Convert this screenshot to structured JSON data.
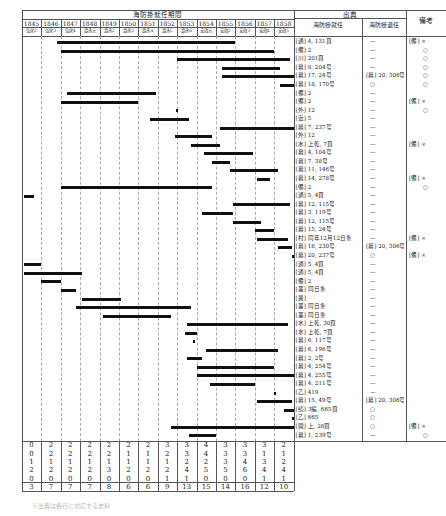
{
  "title": "海防掛就任期間",
  "source_header": "出典",
  "source_sub": [
    "海防掛就任",
    "海防掛退任"
  ],
  "remarks_header": "備考",
  "years": [
    "1845",
    "1846",
    "1847",
    "1848",
    "1849",
    "1850",
    "1851",
    "1852",
    "1853",
    "1854",
    "1855",
    "1856",
    "1857",
    "1858"
  ],
  "eras": [
    "弘化2",
    "弘化3",
    "弘化4",
    "嘉永元",
    "嘉永2",
    "嘉永3",
    "嘉永4",
    "嘉永5",
    "嘉永6",
    "安政元",
    "安政2",
    "安政3",
    "安政4",
    "安政5"
  ],
  "rows": [
    {
      "start": 1.8,
      "end": 11.0,
      "src_in": "[通] 4, 131頁",
      "src_out": "—",
      "note": "[備] ×"
    },
    {
      "start": 2.0,
      "end": 13.0,
      "src_in": "[備] 2",
      "src_out": "—",
      "note": "○"
    },
    {
      "start": 8.0,
      "end": 13.8,
      "src_in": "[川] 201頁",
      "src_out": "—",
      "note": "○"
    },
    {
      "start": 10.3,
      "end": 13.3,
      "src_in": "[幕] 8, 204号",
      "src_out": "—",
      "note": "○"
    },
    {
      "start": 10.3,
      "end": 14.0,
      "src_in": "[幕] 17, 24号",
      "src_out": "[幕] 20, 306号",
      "note": "○"
    },
    {
      "start": 13.3,
      "end": 14.0,
      "src_in": "[幕] 18, 170号",
      "src_out": "○",
      "note": "○"
    },
    {
      "start": 2.3,
      "end": 6.9,
      "src_in": "[備] 2",
      "src_out": "—",
      "note": ""
    },
    {
      "start": 2.0,
      "end": 6.0,
      "src_in": "[備] 2",
      "src_out": "—",
      "note": "[備] ×"
    },
    {
      "start": 7.95,
      "end": 8.05,
      "src_in": "[外] 12",
      "src_out": "—",
      "note": "○"
    },
    {
      "start": 6.6,
      "end": 8.6,
      "src_in": "[近] 5",
      "src_out": "—",
      "note": ""
    },
    {
      "start": 10.2,
      "end": 14.0,
      "src_in": "[幕] 7, 237号",
      "src_out": "—",
      "note": ""
    },
    {
      "start": 7.9,
      "end": 9.8,
      "src_in": "[外] 12",
      "src_out": "—",
      "note": ""
    },
    {
      "start": 8.7,
      "end": 10.2,
      "src_in": "[水] 上乾, 7頁",
      "src_out": "—",
      "note": "[備] ×"
    },
    {
      "start": 9.4,
      "end": 11.9,
      "src_in": "[幕] 4, 104号",
      "src_out": "—",
      "note": ""
    },
    {
      "start": 9.8,
      "end": 10.7,
      "src_in": "[幕] 7, 38号",
      "src_out": "—",
      "note": ""
    },
    {
      "start": 10.7,
      "end": 13.2,
      "src_in": "[幕] 11, 146号",
      "src_out": "—",
      "note": ""
    },
    {
      "start": 12.1,
      "end": 12.8,
      "src_in": "[幕] 14, 278号",
      "src_out": "—",
      "note": "[備] ×"
    },
    {
      "start": 2.0,
      "end": 9.8,
      "src_in": "[備] 2",
      "src_out": "—",
      "note": "○"
    },
    {
      "start": 0.1,
      "end": 0.6,
      "src_in": "[通] 5, 4頁",
      "src_out": "—",
      "note": ""
    },
    {
      "start": 10.9,
      "end": 13.8,
      "src_in": "[幕] 12, 115号",
      "src_out": "—",
      "note": ""
    },
    {
      "start": 9.3,
      "end": 10.9,
      "src_in": "[幕] 3, 119号",
      "src_out": "—",
      "note": ""
    },
    {
      "start": 10.9,
      "end": 12.3,
      "src_in": "[幕] 12, 115号",
      "src_out": "—",
      "note": ""
    },
    {
      "start": 12.0,
      "end": 13.0,
      "src_in": "[幕] 15, 24号",
      "src_out": "—",
      "note": ""
    },
    {
      "start": 12.1,
      "end": 13.7,
      "src_in": "[村] 同年12月12日条",
      "src_out": "—",
      "note": "[備] ×"
    },
    {
      "start": 13.2,
      "end": 13.9,
      "src_in": "[幕] 18, 230号",
      "src_out": "[幕] 20, 306号",
      "note": ""
    },
    {
      "start": 13.9,
      "end": 14.0,
      "src_in": "[幕] 20, 237号",
      "src_out": "○",
      "note": "[備] ×"
    },
    {
      "start": 0.1,
      "end": 1.0,
      "src_in": "[通] 5, 4頁",
      "src_out": "—",
      "note": ""
    },
    {
      "start": 0.1,
      "end": 3.1,
      "src_in": "[通] 5, 4頁",
      "src_out": "—",
      "note": ""
    },
    {
      "start": 1.0,
      "end": 2.0,
      "src_in": "[備] 2",
      "src_out": "—",
      "note": ""
    },
    {
      "start": 2.0,
      "end": 2.8,
      "src_in": "[叢] 同日条",
      "src_out": "—",
      "note": ""
    },
    {
      "start": 3.1,
      "end": 5.1,
      "src_in": "[異]",
      "src_out": "—",
      "note": ""
    },
    {
      "start": 2.8,
      "end": 8.7,
      "src_in": "[叢] 同日条",
      "src_out": "—",
      "note": ""
    },
    {
      "start": 4.2,
      "end": 7.7,
      "src_in": "[叢] 同日条",
      "src_out": "—",
      "note": ""
    },
    {
      "start": 8.5,
      "end": 13.7,
      "src_in": "[水] 上乾, 30頁",
      "src_out": "—",
      "note": ""
    },
    {
      "start": 8.4,
      "end": 9.0,
      "src_in": "[水] 上乾, 7頁",
      "src_out": "—",
      "note": ""
    },
    {
      "start": 8.8,
      "end": 8.9,
      "src_in": "[幕] 6, 117号",
      "src_out": "—",
      "note": ""
    },
    {
      "start": 9.5,
      "end": 13.2,
      "src_in": "[幕] 6, 196号",
      "src_out": "—",
      "note": ""
    },
    {
      "start": 8.5,
      "end": 9.3,
      "src_in": "[幕] 2, 2号",
      "src_out": "—",
      "note": ""
    },
    {
      "start": 9.0,
      "end": 13.0,
      "src_in": "[幕] 4, 254号",
      "src_out": "—",
      "note": ""
    },
    {
      "start": 9.0,
      "end": 14.0,
      "src_in": "[幕] 4, 255号",
      "src_out": "—",
      "note": ""
    },
    {
      "start": 9.7,
      "end": 12.0,
      "src_in": "[幕] 4, 211号",
      "src_out": "—",
      "note": ""
    },
    {
      "start": 13.0,
      "end": 13.1,
      "src_in": "[乙] 419",
      "src_out": "—",
      "note": ""
    },
    {
      "start": 12.1,
      "end": 13.9,
      "src_in": "[幕] 15, 49号",
      "src_out": "[幕] 20, 306号",
      "note": ""
    },
    {
      "start": 13.5,
      "end": 14.0,
      "src_in": "[続] 3編, 665頁",
      "src_out": "○",
      "note": ""
    },
    {
      "start": 13.9,
      "end": 14.0,
      "src_in": "[乙] 665",
      "src_out": "○",
      "note": ""
    },
    {
      "start": 7.7,
      "end": 14.0,
      "src_in": "[開] 上, 28頁",
      "src_out": "○",
      "note": "[備] ×"
    },
    {
      "start": 8.6,
      "end": 10.0,
      "src_in": "[幕] 1, 239号",
      "src_out": "—",
      "note": "○"
    }
  ],
  "summary": [
    [
      0,
      2,
      2,
      2,
      2,
      2,
      2,
      3,
      3,
      4,
      3,
      3,
      3,
      2
    ],
    [
      0,
      2,
      2,
      2,
      2,
      1,
      1,
      2,
      3,
      4,
      3,
      3,
      1,
      1
    ],
    [
      1,
      1,
      1,
      1,
      1,
      1,
      1,
      1,
      2,
      2,
      3,
      4,
      3,
      2
    ],
    [
      2,
      2,
      2,
      2,
      3,
      2,
      2,
      2,
      4,
      5,
      5,
      6,
      4,
      4
    ],
    [
      0,
      0,
      0,
      0,
      0,
      0,
      0,
      1,
      1,
      0,
      0,
      0,
      1,
      1
    ],
    [
      3,
      7,
      7,
      7,
      8,
      6,
      6,
      9,
      13,
      15,
      14,
      16,
      12,
      10
    ]
  ],
  "caption": "※出典は各行に対応する史料"
}
